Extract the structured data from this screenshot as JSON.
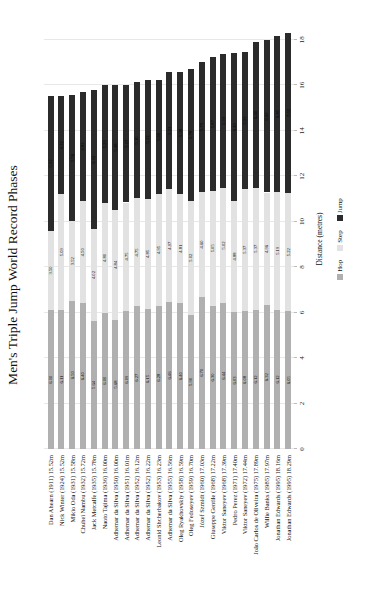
{
  "title": "Men's Triple Jump World Record Phases",
  "xlabel": "Distance (metres)",
  "colors": {
    "series": [
      "#b0b0b0",
      "#e2e2e2",
      "#2b2b2b"
    ],
    "grid": "#e8e8e8",
    "background": "#ffffff",
    "text": "#111111",
    "value_labels": "#000000"
  },
  "chart_data": {
    "type": "bar",
    "stacked": true,
    "orientation": "horizontal",
    "rotation_note": "entire figure rotated 90 degrees counter-clockwise into portrait",
    "title": "Men's Triple Jump World Record Phases",
    "xlabel": "Distance (metres)",
    "xlim": [
      0,
      18
    ],
    "x_ticks": [
      0,
      2,
      4,
      6,
      8,
      10,
      12,
      14,
      16,
      18
    ],
    "grid": true,
    "legend_position": "bottom",
    "legend": [
      "Hop",
      "Step",
      "Jump"
    ],
    "categories": [
      "Dan Ahearn (1911) 15.52m",
      "Nick Winter (1924) 15.52m",
      "Mikio Oda (1931) 15.58m",
      "Chuhei Nambu (1932) 15.72m",
      "Jack Metcalfe (1935) 15.78m",
      "Naoto Tajima (1936) 16.00m",
      "Adhemar da Silva (1950) 16.00m",
      "Adhemar da Silva (1951) 16.01m",
      "Adhemar da Silva (1952) 16.12m",
      "Adhemar da Silva (1952) 16.22m",
      "Leonid Shcherbakov (1953) 16.23m",
      "Adhemar da Silva (1955) 16.56m",
      "Oleg Ryakhovskiy (1958) 16.59m",
      "Oleg Fedoseyev (1959) 16.70m",
      "Józef Szmidt (1960) 17.03m",
      "Giuseppe Gentile (1968) 17.22m",
      "Viktor Saneyev (1968) 17.39m",
      "Pedro Perez (1971) 17.40m",
      "Viktor Saneyev (1972) 17.44m",
      "João Carlos de Oliveira (1975) 17.89m",
      "Willie Banks (1985) 17.97m",
      "Jonathan Edwards (1995) 18.16m",
      "Jonathan Edwards (1995) 18.29m"
    ],
    "totals": [
      15.52,
      15.52,
      15.58,
      15.72,
      15.78,
      16.0,
      16.0,
      16.01,
      16.12,
      16.22,
      16.23,
      16.56,
      16.59,
      16.7,
      17.03,
      17.22,
      17.39,
      17.4,
      17.44,
      17.89,
      17.97,
      18.16,
      18.29
    ],
    "series": [
      {
        "name": "Hop",
        "values": [
          6.1,
          6.11,
          6.5,
          6.4,
          5.64,
          6.0,
          5.68,
          6.09,
          6.27,
          6.15,
          6.28,
          6.46,
          6.4,
          5.9,
          6.7,
          6.3,
          6.44,
          6.03,
          6.08,
          6.12,
          6.32,
          6.12,
          6.05
        ]
      },
      {
        "name": "Step",
        "values": [
          3.5,
          5.09,
          3.52,
          4.5,
          4.02,
          4.8,
          4.84,
          4.75,
          4.75,
          4.85,
          4.95,
          4.97,
          4.81,
          5.02,
          4.6,
          5.05,
          5.02,
          4.88,
          5.37,
          5.37,
          4.96,
          5.19,
          5.22
        ]
      },
      {
        "name": "Jump",
        "values": [
          5.92,
          4.32,
          5.56,
          4.82,
          6.12,
          5.2,
          5.48,
          5.17,
          5.1,
          5.22,
          5.0,
          5.13,
          5.38,
          5.78,
          5.73,
          5.87,
          5.93,
          6.49,
          5.99,
          6.4,
          6.69,
          6.85,
          7.02
        ]
      }
    ]
  }
}
